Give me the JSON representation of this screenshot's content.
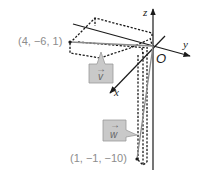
{
  "diagram": {
    "type": "3d-coordinate-vectors",
    "axes": {
      "x_label": "x",
      "y_label": "y",
      "z_label": "z",
      "origin_label": "O"
    },
    "points": [
      {
        "id": "v_tip",
        "label": "(4, −6, 1)"
      },
      {
        "id": "w_tip",
        "label": "(1, −1, −10)"
      }
    ],
    "vectors": [
      {
        "id": "v",
        "name": "v",
        "arrow": "→",
        "from": "O",
        "to": "(4, -6, 1)"
      },
      {
        "id": "w",
        "name": "w",
        "arrow": "→",
        "from": "O",
        "to": "(1, -1, -10)"
      }
    ],
    "colors": {
      "axis": "#1a1a1a",
      "vector": "#8a8a8a",
      "callout_fill": "#c9c9c9",
      "point_label": "#8c8c8c"
    }
  }
}
